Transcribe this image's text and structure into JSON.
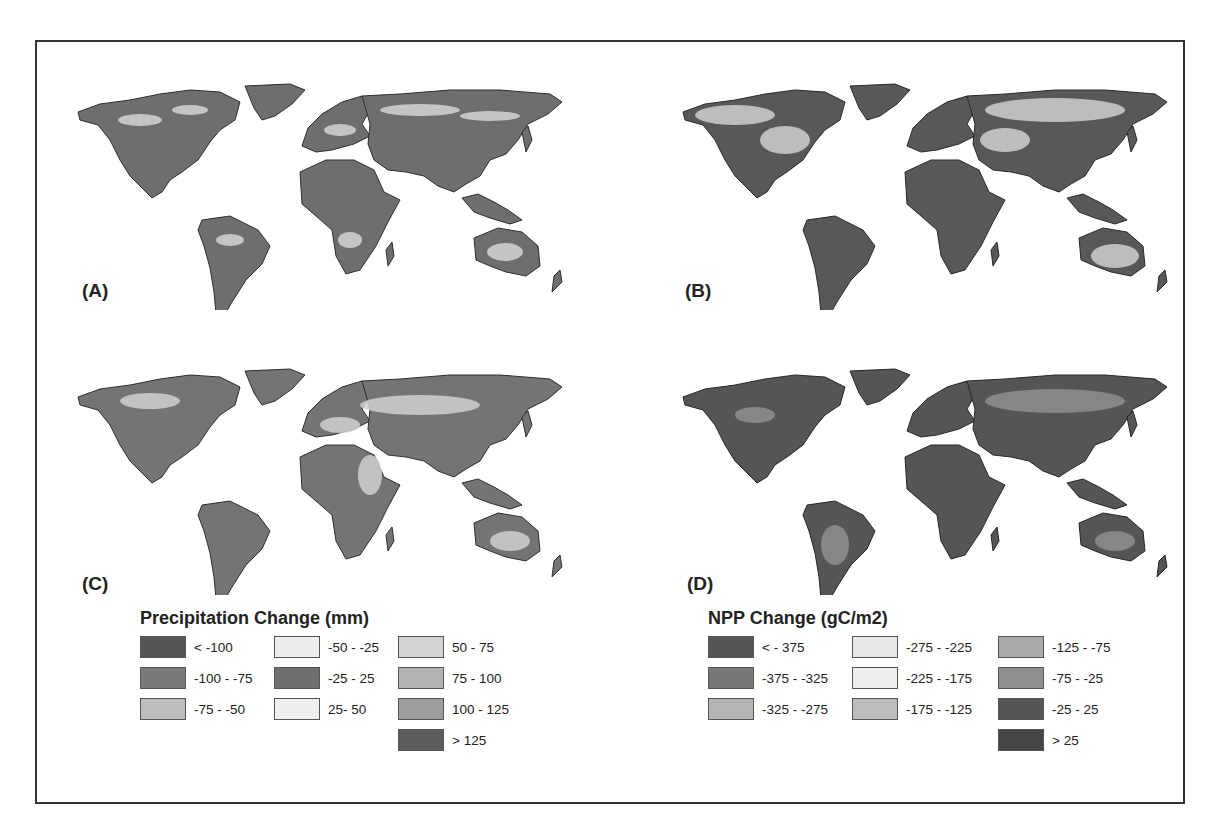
{
  "figure": {
    "panels": [
      {
        "id": "A",
        "label": "(A)",
        "variable": "precipitation"
      },
      {
        "id": "B",
        "label": "(B)",
        "variable": "npp"
      },
      {
        "id": "C",
        "label": "(C)",
        "variable": "precipitation"
      },
      {
        "id": "D",
        "label": "(D)",
        "variable": "npp"
      }
    ],
    "legends": {
      "precipitation": {
        "title": "Precipitation Change (mm)",
        "items": [
          {
            "label": "< -100",
            "color": "#555555"
          },
          {
            "label": "-100 - -75",
            "color": "#7a7a7a"
          },
          {
            "label": "-75 - -50",
            "color": "#bdbdbd"
          },
          {
            "label": "-50 - -25",
            "color": "#ececec"
          },
          {
            "label": "-25 - 25",
            "color": "#6f6f6f"
          },
          {
            "label": "25- 50",
            "color": "#efefef"
          },
          {
            "label": "50 - 75",
            "color": "#d2d2d2"
          },
          {
            "label": "75 - 100",
            "color": "#b3b3b3"
          },
          {
            "label": "100 - 125",
            "color": "#9d9d9d"
          },
          {
            "label": "> 125",
            "color": "#5c5c5c"
          }
        ]
      },
      "npp": {
        "title": "NPP Change (gC/m2)",
        "items": [
          {
            "label": "< - 375",
            "color": "#555555"
          },
          {
            "label": "-375 - -325",
            "color": "#777777"
          },
          {
            "label": "-325 - -275",
            "color": "#b5b5b5"
          },
          {
            "label": "-275 - -225",
            "color": "#e8e8e8"
          },
          {
            "label": "-225 - -175",
            "color": "#eeeeee"
          },
          {
            "label": "-175 - -125",
            "color": "#bcbcbc"
          },
          {
            "label": "-125 - -75",
            "color": "#a9a9a9"
          },
          {
            "label": "-75 - -25",
            "color": "#8f8f8f"
          },
          {
            "label": "-25 - 25",
            "color": "#555555"
          },
          {
            "label": "> 25",
            "color": "#454545"
          }
        ]
      }
    },
    "caption_visible_fragment": "... different ... and ... (2000-2009)"
  }
}
